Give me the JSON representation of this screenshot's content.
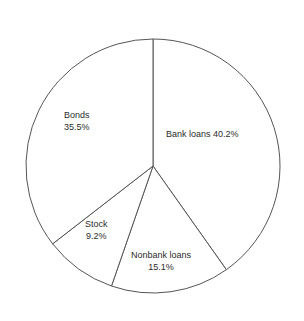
{
  "title": "Introduction to Finance and Macroeconomics",
  "chart_data": {
    "type": "pie",
    "title": "Introduction to Finance and Macroeconomics",
    "xlabel": "",
    "ylabel": "",
    "grid": false,
    "legend": "none",
    "label_style": "inline-on-slice",
    "start_angle_deg": 0,
    "direction": "clockwise",
    "units": "percent",
    "total": 100.0,
    "categories": [
      "Bank loans",
      "Nonbank loans",
      "Stock",
      "Bonds"
    ],
    "values": [
      40.2,
      15.1,
      9.2,
      35.5
    ],
    "slices": [
      {
        "name": "Bank loans",
        "value": 40.2,
        "label_text": "Bank loans 40.2%",
        "value_text": "40.2%",
        "lines": [
          "Bank loans 40.2%"
        ]
      },
      {
        "name": "Nonbank loans",
        "value": 15.1,
        "label_text": "Nonbank loans 15.1%",
        "value_text": "15.1%",
        "lines": [
          "Nonbank loans",
          "15.1%"
        ]
      },
      {
        "name": "Stock",
        "value": 9.2,
        "label_text": "Stock 9.2%",
        "value_text": "9.2%",
        "lines": [
          "Stock",
          "9.2%"
        ]
      },
      {
        "name": "Bonds",
        "value": 35.5,
        "label_text": "Bonds 35.5%",
        "value_text": "35.5%",
        "lines": [
          "Bonds",
          "35.5%"
        ]
      }
    ],
    "colors": {
      "slice_fill": "#ffffff",
      "slice_stroke": "#555555",
      "text": "#2b2b2b",
      "background": "#ffffff"
    },
    "geometry": {
      "center_x": 153,
      "center_y": 166,
      "radius": 127
    }
  }
}
